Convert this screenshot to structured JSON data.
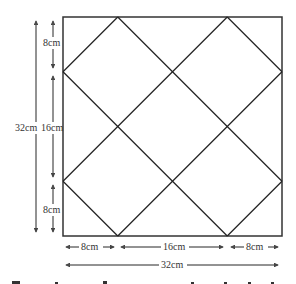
{
  "diagram": {
    "square": {
      "side": "32cm"
    },
    "vertical_dimensions": {
      "total": "32cm",
      "segments": [
        "8cm",
        "16cm",
        "8cm"
      ]
    },
    "horizontal_dimensions": {
      "total": "32cm",
      "segments": [
        "8cm",
        "16cm",
        "8cm"
      ]
    },
    "colors": {
      "line": "#222222",
      "dimension": "#555555",
      "background": "#ffffff"
    }
  }
}
